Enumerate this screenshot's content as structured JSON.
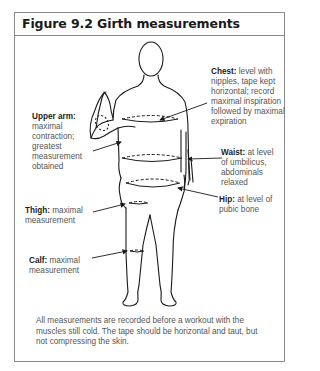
{
  "figure": {
    "title": "Figure 9.2 Girth measurements",
    "labels": {
      "chest": {
        "term": "Chest:",
        "desc": "level with nipples, tape kept horizontal; record maximal inspiration followed by maximal expiration"
      },
      "upper_arm": {
        "term": "Upper arm:",
        "desc": "maximal contraction; greatest measurement obtained"
      },
      "waist": {
        "term": "Waist:",
        "desc": "at level of umbilicus, abdominals relaxed"
      },
      "hip": {
        "term": "Hip:",
        "desc": "at level of pubic bone"
      },
      "thigh": {
        "term": "Thigh:",
        "desc": "maximal measurement"
      },
      "calf": {
        "term": "Calf:",
        "desc": "maximal measurement"
      }
    },
    "caption": "All measurements are recorded before a workout with the muscles still cold. The tape should be horizontal and taut, but not compressing the skin."
  }
}
